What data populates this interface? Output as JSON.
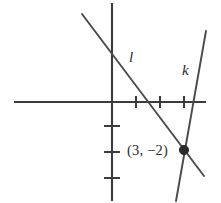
{
  "figure": {
    "type": "coordinate-graph",
    "background_color": "#ffffff",
    "stroke_color": "#3b3b3b",
    "line_color": "#4a4a4a",
    "point_color": "#2b2b2b"
  },
  "axes": {
    "origin": {
      "x": 112,
      "y": 102
    },
    "unit_px_x": 24,
    "unit_px_y": 26,
    "x_axis": {
      "x1": 14,
      "y1": 102,
      "x2": 206,
      "y2": 102
    },
    "y_axis": {
      "x1": 112,
      "y1": 3,
      "x2": 112,
      "y2": 201
    },
    "x_ticks": [
      {
        "value": 1,
        "x": 136,
        "half_len": 6
      },
      {
        "value": 2,
        "x": 160,
        "half_len": 6
      },
      {
        "value": 3,
        "x": 184,
        "half_len": 6
      }
    ],
    "y_ticks": [
      {
        "value": -1,
        "y": 126,
        "half_len": 8
      },
      {
        "value": -2,
        "y": 152,
        "half_len": 8
      },
      {
        "value": -3,
        "y": 178,
        "half_len": 8
      }
    ]
  },
  "lines": [
    {
      "id": "l",
      "label": "l",
      "description": "negative slope line through (3, -2)",
      "x1": 82,
      "y1": 14,
      "x2": 204,
      "y2": 176
    },
    {
      "id": "k",
      "label": "k",
      "description": "steep positive slope line through (3, -2)",
      "x1": 206,
      "y1": 31,
      "x2": 176,
      "y2": 201
    }
  ],
  "points": [
    {
      "label": "(3, −2)",
      "coordinates": {
        "x": 3,
        "y": -2
      },
      "px": {
        "x": 184,
        "y": 150
      },
      "radius": 4.6
    }
  ],
  "labels": {
    "line_l": "l",
    "line_k": "k",
    "point": "(3, −2)"
  }
}
